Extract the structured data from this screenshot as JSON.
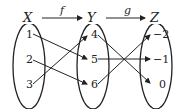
{
  "sets": [
    {
      "name": "X",
      "elements": [
        "1",
        "2",
        "3"
      ]
    },
    {
      "name": "Y",
      "elements": [
        "4",
        "5",
        "6"
      ]
    },
    {
      "name": "Z",
      "elements": [
        "−2",
        "−1",
        "0"
      ]
    }
  ],
  "functions": [
    {
      "name": "f",
      "from": "X",
      "to": "Y",
      "mappings": [
        {
          "from": "1",
          "to": "5"
        },
        {
          "from": "2",
          "to": "6"
        },
        {
          "from": "3",
          "to": "4"
        }
      ]
    },
    {
      "name": "g",
      "from": "Y",
      "to": "Z",
      "mappings": [
        {
          "from": "4",
          "to": "0"
        },
        {
          "from": "5",
          "to": "−1"
        },
        {
          "from": "6",
          "to": "−2"
        }
      ]
    }
  ]
}
